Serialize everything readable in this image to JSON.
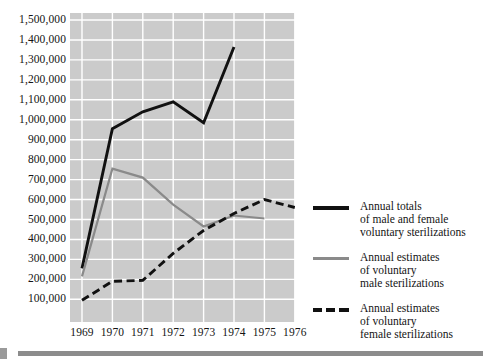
{
  "chart_data": {
    "type": "line",
    "title": "",
    "subtitle": "",
    "xlabel": "",
    "ylabel": "",
    "grid": true,
    "legend_position": "right",
    "x": [
      1969,
      1970,
      1971,
      1972,
      1973,
      1974,
      1975,
      1976
    ],
    "categories": [
      "1969",
      "1970",
      "1971",
      "1972",
      "1973",
      "1974",
      "1975",
      "1976"
    ],
    "ylim": [
      0,
      1500000
    ],
    "ytick_values": [
      1500000,
      1400000,
      1300000,
      1200000,
      1100000,
      1000000,
      900000,
      800000,
      700000,
      600000,
      500000,
      400000,
      300000,
      200000,
      100000
    ],
    "ytick_labels": [
      "1,500,000",
      "1,400,000",
      "1,300,000",
      "1,200,000",
      "1,100,000",
      "1,000,000",
      "900,000",
      "800,000",
      "700,000",
      "600,000",
      "500,000",
      "400,000",
      "300,000",
      "200,000",
      "100,000"
    ],
    "xtick_labels": [
      "1969",
      "1970",
      "1971",
      "1972",
      "1973",
      "1974",
      "1975",
      "1976"
    ],
    "series": [
      {
        "name": "Annual totals of male and female voluntary sterilizations",
        "style": "solid",
        "color": "#111111",
        "x": [
          1969,
          1970,
          1971,
          1972,
          1973,
          1974
        ],
        "values": [
          255000,
          955000,
          1040000,
          1090000,
          985000,
          1365000
        ]
      },
      {
        "name": "Annual estimates of voluntary male sterilizations",
        "style": "solid",
        "color": "#8a8a8a",
        "x": [
          1969,
          1970,
          1971,
          1972,
          1973,
          1974,
          1975
        ],
        "values": [
          215000,
          755000,
          710000,
          575000,
          465000,
          520000,
          505000
        ]
      },
      {
        "name": "Annual estimates of voluntary female sterilizations",
        "style": "dashed",
        "color": "#111111",
        "x": [
          1969,
          1970,
          1971,
          1972,
          1973,
          1974,
          1975,
          1976
        ],
        "values": [
          95000,
          190000,
          195000,
          330000,
          445000,
          530000,
          600000,
          560000
        ]
      }
    ]
  },
  "legend": {
    "entries": [
      {
        "swatch": "solid-black",
        "line1": "Annual totals",
        "line2": "of male and female",
        "line3": "voluntary sterilizations"
      },
      {
        "swatch": "solid-gray",
        "line1": "Annual estimates",
        "line2": "of voluntary",
        "line3": "male sterilizations"
      },
      {
        "swatch": "dashed-black",
        "line1": "Annual estimates",
        "line2": "of voluntary",
        "line3": "female sterilizations"
      }
    ]
  },
  "colors": {
    "plot_background": "#cbcbcb",
    "gridline": "#ffffff",
    "total_series": "#111111",
    "male_series": "#8a8a8a",
    "female_series": "#111111",
    "footer_bar": "#8c8c8c",
    "page_background": "#ffffff"
  }
}
